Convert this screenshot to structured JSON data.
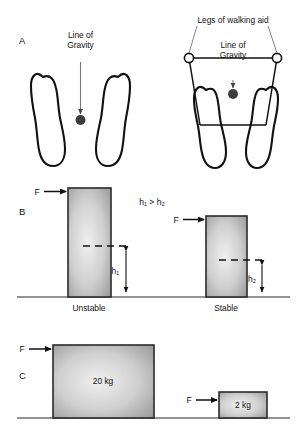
{
  "figure": {
    "background": "#ffffff",
    "stroke_color": "#111111",
    "line_color": "#555555",
    "dot_color": "#3a3a3a",
    "box_fill_light": "#e9e9e9",
    "box_fill_dark": "#8e8e8e",
    "ground_color": "#6f6f6f"
  },
  "panels": {
    "a": {
      "letter": "A",
      "left": {
        "line_of_gravity_label_1": "Line of",
        "line_of_gravity_label_2": "Gravity"
      },
      "right": {
        "walking_aid_label": "Legs of walking aid",
        "line_of_gravity_label_1": "Line of",
        "line_of_gravity_label_2": "Gravity"
      }
    },
    "b": {
      "letter": "B",
      "comparison": "h₁ > h₂",
      "left": {
        "force_label": "F",
        "height_label": "h₁",
        "caption": "Unstable"
      },
      "right": {
        "force_label": "F",
        "height_label": "h₂",
        "caption": "Stable"
      }
    },
    "c": {
      "letter": "C",
      "left": {
        "force_label": "F",
        "mass_label": "20 kg"
      },
      "right": {
        "force_label": "F",
        "mass_label": "2 kg"
      }
    }
  }
}
